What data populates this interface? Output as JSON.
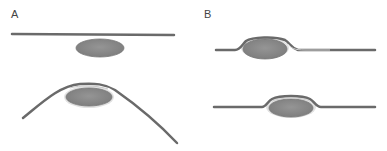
{
  "panels": [
    {
      "id": "A",
      "label": "A",
      "diagrams": [
        "flat-line-above-ellipse",
        "curved-line-over-ellipse"
      ]
    },
    {
      "id": "B",
      "label": "B",
      "diagrams": [
        "line-with-bulge-over-ellipse",
        "line-with-bulge-over-ellipse"
      ]
    }
  ],
  "colors": {
    "line": "#6a6a6a",
    "line_highlight": "#c8c8c8",
    "ellipse_fill": "#8a8a8a",
    "ellipse_edge": "#707070",
    "ellipse_glow": "#d8d8d8",
    "background": "#ffffff"
  }
}
